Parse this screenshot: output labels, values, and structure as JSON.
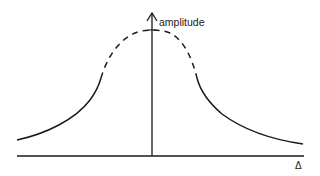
{
  "diagram": {
    "type": "lorentzian-resonance-curve",
    "y_axis_label": "amplitude",
    "x_axis_label": "Δ",
    "colors": {
      "stroke": "#1a1a1a",
      "background": "#ffffff"
    },
    "curve": {
      "solid_left": "M17,140 C45,134 75,120 90,100 C96,92 99,85 101,78",
      "dashed_peak": "M101,78 C106,60 118,40 135,33 C145,29 160,29 170,33 C184,40 192,58 197,78",
      "solid_right": "M197,78 C200,90 208,102 222,114 C245,131 275,140 303,144"
    },
    "axes": {
      "x": {
        "x1": 17,
        "y1": 156,
        "x2": 304,
        "y2": 156
      },
      "y": {
        "x1": 152,
        "y1": 156,
        "x2": 152,
        "y2": 13
      }
    }
  }
}
